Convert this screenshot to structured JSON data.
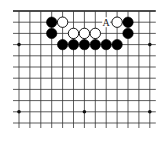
{
  "diagram": {
    "type": "go-board-fragment",
    "columns": 13,
    "rows": 11,
    "top_edge": true,
    "grid": {
      "origin_x": 19,
      "origin_y": 11,
      "dx": 10.9,
      "dy": 11.2,
      "line_color": "#333333",
      "edge_color": "#111111"
    },
    "star_points": [
      {
        "col": 0,
        "row": 3
      },
      {
        "col": 6,
        "row": 3
      },
      {
        "col": 12,
        "row": 3
      },
      {
        "col": 0,
        "row": 9
      },
      {
        "col": 6,
        "row": 9
      },
      {
        "col": 12,
        "row": 9
      }
    ],
    "stones": [
      {
        "color": "black",
        "col": 3,
        "row": 1
      },
      {
        "color": "black",
        "col": 3,
        "row": 2
      },
      {
        "color": "white",
        "col": 4,
        "row": 1
      },
      {
        "color": "white",
        "col": 5,
        "row": 2
      },
      {
        "color": "white",
        "col": 6,
        "row": 2
      },
      {
        "color": "white",
        "col": 7,
        "row": 2
      },
      {
        "color": "white",
        "col": 9,
        "row": 1
      },
      {
        "color": "black",
        "col": 10,
        "row": 1
      },
      {
        "color": "black",
        "col": 10,
        "row": 2
      },
      {
        "color": "black",
        "col": 4,
        "row": 3
      },
      {
        "color": "black",
        "col": 5,
        "row": 3
      },
      {
        "color": "black",
        "col": 6,
        "row": 3
      },
      {
        "color": "black",
        "col": 7,
        "row": 3
      },
      {
        "color": "black",
        "col": 8,
        "row": 3
      },
      {
        "color": "black",
        "col": 9,
        "row": 3
      }
    ],
    "labels": [
      {
        "text": "A",
        "col": 8,
        "row": 1
      }
    ]
  }
}
